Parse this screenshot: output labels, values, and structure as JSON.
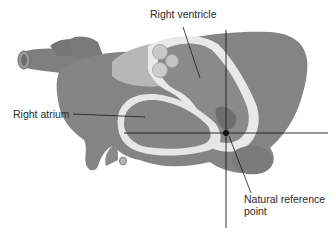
{
  "diagram": {
    "labels": {
      "right_ventricle": "Right ventricle",
      "right_atrium": "Right atrium",
      "reference_line1": "Natural reference",
      "reference_line2": "point"
    },
    "colors": {
      "background": "#ffffff",
      "tissue_dark": "#7d7d7d",
      "tissue_mid": "#8e8e8e",
      "tissue_light": "#b9b9b9",
      "wall_light": "#e8e8e8",
      "line": "#1a1a1a"
    }
  }
}
